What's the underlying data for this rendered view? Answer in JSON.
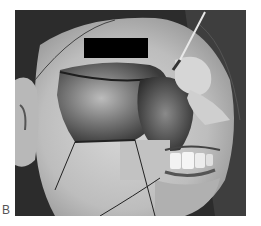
{
  "figure": {
    "panel_label": "B",
    "photo_description": "Grayscale intraoperative photograph of a face with a large facial flap raised, exposed teeth, retractor instrument and sutures",
    "redaction_bar_color": "#000000"
  }
}
